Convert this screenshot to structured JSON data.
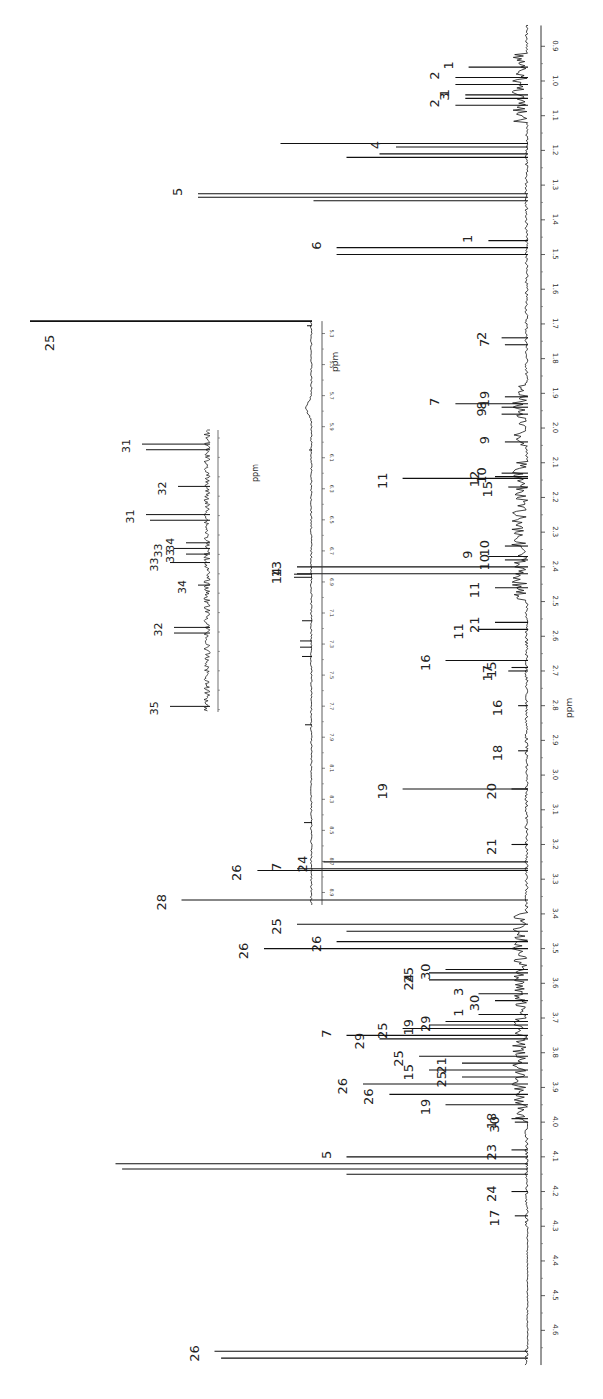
{
  "chart_data": {
    "type": "line",
    "title": "",
    "subtitle": "1H NMR spectrum with numbered peak assignments (rotated 90°)",
    "xlabel": "ppm",
    "ylabel": "",
    "orientation": "rotated-90 (ppm axis vertical on right, intensity extends left)",
    "grid": false,
    "legend": null,
    "main_axis": {
      "label": "ppm",
      "range": [
        0.83,
        4.72
      ],
      "ticks": [
        0.9,
        1.0,
        1.1,
        1.2,
        1.3,
        1.4,
        1.5,
        1.6,
        1.7,
        1.8,
        1.9,
        2.0,
        2.1,
        2.2,
        2.3,
        2.4,
        2.5,
        2.6,
        2.7,
        2.8,
        2.9,
        3.0,
        3.1,
        3.2,
        3.3,
        3.4,
        3.5,
        3.6,
        3.7,
        3.8,
        3.9,
        4.0,
        4.1,
        4.2,
        4.3,
        4.4,
        4.5,
        4.6
      ],
      "tick_labels": [
        "0.9",
        "1.0",
        "1.1",
        "1.2",
        "1.3",
        "1.4",
        "1.5",
        "1.6",
        "1.7",
        "1.8",
        "1.9",
        "2.0",
        "2.1",
        "2.2",
        "2.3",
        "2.4",
        "2.5",
        "2.6",
        "2.7",
        "2.8",
        "2.9",
        "3.0",
        "3.1",
        "3.2",
        "3.3",
        "3.4",
        "3.5",
        "3.6",
        "3.7",
        "3.8",
        "3.9",
        "4.0",
        "4.1",
        "4.2",
        "4.3",
        "4.4",
        "4.5",
        "4.6"
      ]
    },
    "main_peaks": [
      {
        "ppm": 0.96,
        "intensity": 0.18,
        "label": "1"
      },
      {
        "ppm": 0.99,
        "intensity": 0.22,
        "label": "2"
      },
      {
        "ppm": 1.01,
        "intensity": 0.22,
        "label": ""
      },
      {
        "ppm": 1.04,
        "intensity": 0.19,
        "label": "1"
      },
      {
        "ppm": 1.05,
        "intensity": 0.19,
        "label": "3"
      },
      {
        "ppm": 1.07,
        "intensity": 0.22,
        "label": "2"
      },
      {
        "ppm": 1.18,
        "intensity": 0.75,
        "label": ""
      },
      {
        "ppm": 1.19,
        "intensity": 0.4,
        "label": "4"
      },
      {
        "ppm": 1.21,
        "intensity": 0.45,
        "label": ""
      },
      {
        "ppm": 1.22,
        "intensity": 0.55,
        "label": ""
      },
      {
        "ppm": 1.325,
        "intensity": 1.0,
        "label": "5"
      },
      {
        "ppm": 1.335,
        "intensity": 1.0,
        "label": ""
      },
      {
        "ppm": 1.345,
        "intensity": 0.65,
        "label": ""
      },
      {
        "ppm": 1.46,
        "intensity": 0.12,
        "label": "1"
      },
      {
        "ppm": 1.48,
        "intensity": 0.58,
        "label": "6"
      },
      {
        "ppm": 1.5,
        "intensity": 0.58,
        "label": ""
      },
      {
        "ppm": 1.74,
        "intensity": 0.08,
        "label": "2"
      },
      {
        "ppm": 1.76,
        "intensity": 0.07,
        "label": "7"
      },
      {
        "ppm": 1.93,
        "intensity": 0.22,
        "label": "7"
      },
      {
        "ppm": 1.94,
        "intensity": 0.08,
        "label": "8"
      },
      {
        "ppm": 1.96,
        "intensity": 0.08,
        "label": "9"
      },
      {
        "ppm": 1.91,
        "intensity": 0.07,
        "label": "19"
      },
      {
        "ppm": 2.04,
        "intensity": 0.07,
        "label": "9"
      },
      {
        "ppm": 2.13,
        "intensity": 0.08,
        "label": "10"
      },
      {
        "ppm": 2.14,
        "intensity": 0.1,
        "label": "12"
      },
      {
        "ppm": 2.145,
        "intensity": 0.38,
        "label": "11"
      },
      {
        "ppm": 2.17,
        "intensity": 0.06,
        "label": "15"
      },
      {
        "ppm": 2.34,
        "intensity": 0.07,
        "label": "10"
      },
      {
        "ppm": 2.37,
        "intensity": 0.12,
        "label": "9"
      },
      {
        "ppm": 2.38,
        "intensity": 0.07,
        "label": "10"
      },
      {
        "ppm": 2.4,
        "intensity": 0.7,
        "label": "13"
      },
      {
        "ppm": 2.42,
        "intensity": 0.7,
        "label": "14"
      },
      {
        "ppm": 2.46,
        "intensity": 0.1,
        "label": "11"
      },
      {
        "ppm": 2.56,
        "intensity": 0.1,
        "label": "21"
      },
      {
        "ppm": 2.58,
        "intensity": 0.15,
        "label": "11"
      },
      {
        "ppm": 2.67,
        "intensity": 0.25,
        "label": "16"
      },
      {
        "ppm": 2.7,
        "intensity": 0.06,
        "label": "17"
      },
      {
        "ppm": 2.69,
        "intensity": 0.05,
        "label": "15"
      },
      {
        "ppm": 2.8,
        "intensity": 0.03,
        "label": "16"
      },
      {
        "ppm": 2.93,
        "intensity": 0.03,
        "label": "18"
      },
      {
        "ppm": 3.04,
        "intensity": 0.38,
        "label": "19"
      },
      {
        "ppm": 3.04,
        "intensity": 0.05,
        "label": "20"
      },
      {
        "ppm": 3.2,
        "intensity": 0.05,
        "label": "21"
      },
      {
        "ppm": 3.25,
        "intensity": 0.62,
        "label": "24"
      },
      {
        "ppm": 3.27,
        "intensity": 0.7,
        "label": "7"
      },
      {
        "ppm": 3.275,
        "intensity": 0.82,
        "label": "26"
      },
      {
        "ppm": 3.36,
        "intensity": 1.05,
        "label": "28"
      },
      {
        "ppm": 3.43,
        "intensity": 0.7,
        "label": "25"
      },
      {
        "ppm": 3.45,
        "intensity": 0.55,
        "label": ""
      },
      {
        "ppm": 3.48,
        "intensity": 0.58,
        "label": "26"
      },
      {
        "ppm": 3.5,
        "intensity": 0.8,
        "label": "26"
      },
      {
        "ppm": 3.56,
        "intensity": 0.25,
        "label": "30"
      },
      {
        "ppm": 3.57,
        "intensity": 0.3,
        "label": "25"
      },
      {
        "ppm": 3.59,
        "intensity": 0.3,
        "label": "24"
      },
      {
        "ppm": 3.63,
        "intensity": 0.15,
        "label": "3"
      },
      {
        "ppm": 3.65,
        "intensity": 0.1,
        "label": "30"
      },
      {
        "ppm": 3.69,
        "intensity": 0.15,
        "label": "1"
      },
      {
        "ppm": 3.71,
        "intensity": 0.25,
        "label": "29"
      },
      {
        "ppm": 3.72,
        "intensity": 0.3,
        "label": "19"
      },
      {
        "ppm": 3.73,
        "intensity": 0.38,
        "label": "25"
      },
      {
        "ppm": 3.75,
        "intensity": 0.55,
        "label": "7"
      },
      {
        "ppm": 3.76,
        "intensity": 0.45,
        "label": "29"
      },
      {
        "ppm": 3.81,
        "intensity": 0.33,
        "label": "25"
      },
      {
        "ppm": 3.83,
        "intensity": 0.2,
        "label": "21"
      },
      {
        "ppm": 3.85,
        "intensity": 0.3,
        "label": "15"
      },
      {
        "ppm": 3.87,
        "intensity": 0.2,
        "label": "25"
      },
      {
        "ppm": 3.89,
        "intensity": 0.5,
        "label": "26"
      },
      {
        "ppm": 3.92,
        "intensity": 0.42,
        "label": "26"
      },
      {
        "ppm": 3.95,
        "intensity": 0.25,
        "label": "19"
      },
      {
        "ppm": 3.99,
        "intensity": 0.05,
        "label": "18"
      },
      {
        "ppm": 4.0,
        "intensity": 0.04,
        "label": "30"
      },
      {
        "ppm": 4.08,
        "intensity": 0.05,
        "label": "23"
      },
      {
        "ppm": 4.1,
        "intensity": 0.55,
        "label": "5"
      },
      {
        "ppm": 4.12,
        "intensity": 1.25,
        "label": ""
      },
      {
        "ppm": 4.135,
        "intensity": 1.23,
        "label": ""
      },
      {
        "ppm": 4.15,
        "intensity": 0.55,
        "label": ""
      },
      {
        "ppm": 4.2,
        "intensity": 0.05,
        "label": "24"
      },
      {
        "ppm": 4.27,
        "intensity": 0.04,
        "label": "17"
      },
      {
        "ppm": 4.66,
        "intensity": 0.95,
        "label": "26"
      },
      {
        "ppm": 4.68,
        "intensity": 0.93,
        "label": ""
      }
    ],
    "inset_1": {
      "label": "ppm",
      "range": [
        5.2,
        9.0
      ],
      "ticks": [
        5.3,
        5.5,
        5.7,
        5.9,
        6.1,
        6.3,
        6.5,
        6.7,
        6.9,
        7.1,
        7.3,
        7.5,
        7.7,
        7.9,
        8.1,
        8.3,
        8.5,
        8.7,
        8.9
      ],
      "tick_labels": [
        "5.3",
        "5.5",
        "5.7",
        "5.9",
        "6.1",
        "6.3",
        "6.5",
        "6.7",
        "6.9",
        "7.1",
        "7.3",
        "7.5",
        "7.7",
        "7.9",
        "8.1",
        "8.3",
        "8.5",
        "8.7",
        "8.9"
      ],
      "peaks": [
        {
          "ppm": 5.22,
          "intensity": 1.0,
          "label": "25"
        },
        {
          "ppm": 5.25,
          "intensity": 0.05,
          "label": ""
        },
        {
          "ppm": 6.05,
          "intensity": 0.03,
          "label": ""
        },
        {
          "ppm": 6.85,
          "intensity": 0.18,
          "label": ""
        },
        {
          "ppm": 6.87,
          "intensity": 0.18,
          "label": ""
        },
        {
          "ppm": 7.15,
          "intensity": 0.1,
          "label": ""
        },
        {
          "ppm": 7.28,
          "intensity": 0.12,
          "label": ""
        },
        {
          "ppm": 7.32,
          "intensity": 0.12,
          "label": ""
        },
        {
          "ppm": 7.38,
          "intensity": 0.1,
          "label": ""
        },
        {
          "ppm": 7.82,
          "intensity": 0.07,
          "label": ""
        },
        {
          "ppm": 8.45,
          "intensity": 0.08,
          "label": ""
        }
      ]
    },
    "inset_2": {
      "label": "ppm",
      "peaks": [
        {
          "pos": 0.05,
          "intensity": 0.85,
          "label": "31"
        },
        {
          "pos": 0.07,
          "intensity": 0.8,
          "label": ""
        },
        {
          "pos": 0.2,
          "intensity": 0.4,
          "label": "32"
        },
        {
          "pos": 0.3,
          "intensity": 0.8,
          "label": "31"
        },
        {
          "pos": 0.32,
          "intensity": 0.75,
          "label": ""
        },
        {
          "pos": 0.4,
          "intensity": 0.3,
          "label": "34"
        },
        {
          "pos": 0.42,
          "intensity": 0.45,
          "label": "33"
        },
        {
          "pos": 0.44,
          "intensity": 0.3,
          "label": "33"
        },
        {
          "pos": 0.47,
          "intensity": 0.5,
          "label": "33"
        },
        {
          "pos": 0.55,
          "intensity": 0.15,
          "label": "34"
        },
        {
          "pos": 0.7,
          "intensity": 0.45,
          "label": "32"
        },
        {
          "pos": 0.72,
          "intensity": 0.45,
          "label": ""
        },
        {
          "pos": 0.98,
          "intensity": 0.5,
          "label": "35"
        }
      ]
    }
  },
  "labels": {
    "main_axis_title": "ppm",
    "inset1_axis_title": "ppm",
    "inset2_axis_title": "ppm"
  }
}
